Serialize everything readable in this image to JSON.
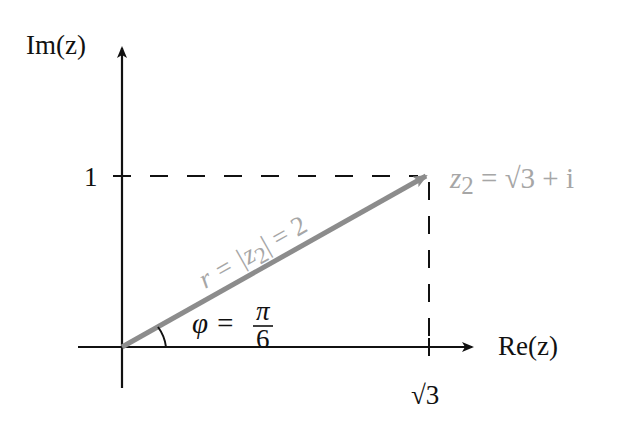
{
  "diagram": {
    "axes": {
      "x_label": "Re(z)",
      "y_label": "Im(z)",
      "x_tick": "√3",
      "y_tick": "1"
    },
    "vector": {
      "label_left": "z",
      "label_sub": "2",
      "label_right": " = √3 + i",
      "modulus_label_a": "r = |z",
      "modulus_label_sub": "2",
      "modulus_label_b": "| = 2",
      "color": "#9a9a9a"
    },
    "angle": {
      "label": "φ =",
      "numerator": "π",
      "denominator": "6"
    }
  }
}
